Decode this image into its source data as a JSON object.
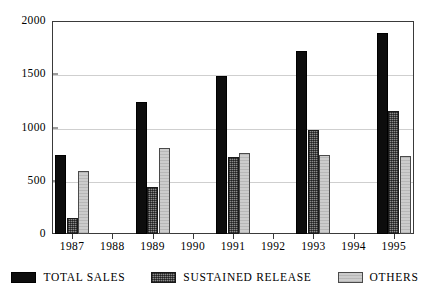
{
  "chart_data": {
    "type": "bar",
    "title": "",
    "xlabel": "",
    "ylabel": "",
    "ylim": [
      0,
      2000
    ],
    "yticks": [
      0,
      500,
      1000,
      1500,
      2000
    ],
    "ytick_labels": [
      "0",
      "500",
      "1000",
      "1500",
      "2000"
    ],
    "grid": true,
    "legend_position": "bottom",
    "categories": [
      "1987",
      "1988",
      "1989",
      "1990",
      "1991",
      "1992",
      "1993",
      "1994",
      "1995"
    ],
    "series": [
      {
        "name": "TOTAL SALES",
        "color": "#0d0d0d",
        "values": [
          742,
          null,
          1240,
          null,
          1480,
          null,
          1715,
          null,
          1890
        ]
      },
      {
        "name": "SUSTAINED RELEASE",
        "color": "#8a8a8a",
        "values": [
          155,
          null,
          440,
          null,
          720,
          null,
          975,
          null,
          1155
        ]
      },
      {
        "name": "OTHERS",
        "color": "#cccccc",
        "values": [
          590,
          null,
          805,
          null,
          760,
          null,
          745,
          null,
          730
        ]
      }
    ]
  }
}
